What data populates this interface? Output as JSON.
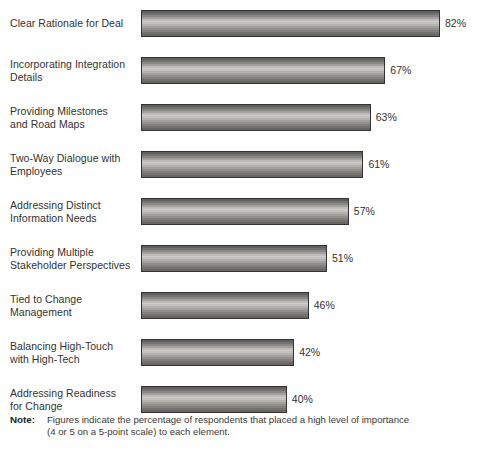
{
  "chart_data": {
    "type": "bar",
    "orientation": "horizontal",
    "title": "",
    "subtitle": "",
    "xlabel": "",
    "ylabel": "",
    "xlim": [
      0,
      82
    ],
    "grid": false,
    "legend": null,
    "value_suffix": "%",
    "categories": [
      "Clear Rationale for Deal",
      "Incorporating Integration\nDetails",
      "Providing Milestones\nand Road Maps",
      "Two-Way Dialogue with\nEmployees",
      "Addressing Distinct\nInformation Needs",
      "Providing Multiple\nStakeholder Perspectives",
      "Tied to Change\nManagement",
      "Balancing High-Touch\nwith High-Tech",
      "Addressing Readiness\nfor Change"
    ],
    "values": [
      82,
      67,
      63,
      61,
      57,
      51,
      46,
      42,
      40
    ],
    "data_labels": [
      "82%",
      "67%",
      "63%",
      "61%",
      "57%",
      "51%",
      "46%",
      "42%",
      "40%"
    ],
    "series": [
      {
        "name": "Percentage of respondents rating high importance",
        "values": [
          82,
          67,
          63,
          61,
          57,
          51,
          46,
          42,
          40
        ]
      }
    ]
  },
  "note": {
    "label": "Note:",
    "text": "Figures indicate the percentage of respondents that placed a high level of importance\n(4 or 5 on a 5-point scale) to each element."
  },
  "colors": {
    "bar_fill_light": "#cfcdc9",
    "bar_fill_dark": "#555453",
    "bar_border": "#333333",
    "text": "#33322f",
    "background": "#ffffff"
  }
}
